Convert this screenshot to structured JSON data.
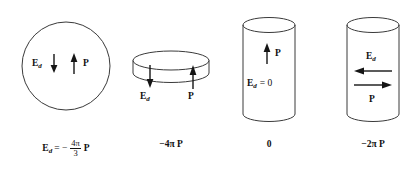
{
  "figure": {
    "background_color": "#ffffff",
    "stroke_color": "#3a3a3a",
    "arrow_color": "#151515",
    "width": 420,
    "height": 171
  },
  "panels": [
    {
      "id": "sphere",
      "shape_name": "sphere",
      "field_label": "E",
      "field_subscript": "d",
      "field_arrow_direction": "down",
      "polarization_label": "P",
      "polarization_arrow_direction": "up",
      "caption": {
        "lhs": "E",
        "lhs_subscript": "d",
        "equals": "= −",
        "numerator": "4π",
        "denominator": "3",
        "trailing": "P"
      }
    },
    {
      "id": "thin-slab",
      "shape_name": "thin-disk",
      "field_label": "E",
      "field_subscript": "d",
      "field_arrow_direction": "down",
      "polarization_label": "P",
      "polarization_arrow_direction": "up",
      "caption": {
        "text": "−4π P"
      }
    },
    {
      "id": "long-cylinder-axial",
      "shape_name": "cylinder",
      "field_label": "E",
      "field_subscript": "d",
      "field_value_text": "= 0",
      "polarization_label": "P",
      "polarization_arrow_direction": "up",
      "caption": {
        "text": "0"
      }
    },
    {
      "id": "long-cylinder-transverse",
      "shape_name": "cylinder",
      "field_label": "E",
      "field_subscript": "d",
      "field_arrow_direction": "left",
      "polarization_label": "P",
      "polarization_arrow_direction": "right",
      "caption": {
        "text": "−2π P"
      }
    }
  ]
}
